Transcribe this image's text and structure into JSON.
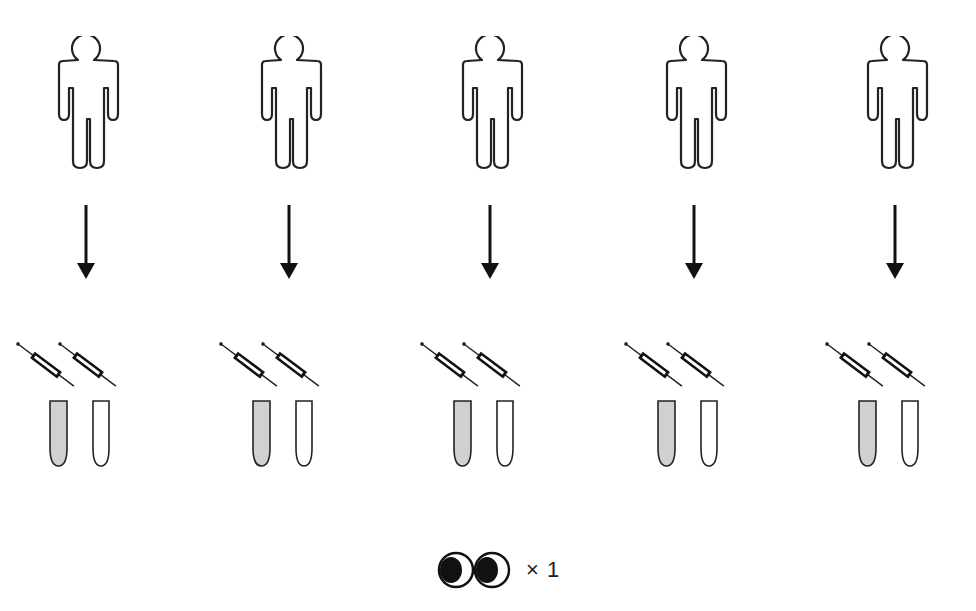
{
  "diagram": {
    "type": "sampling-schema",
    "columns": [
      {
        "id": 1,
        "center_x": 86,
        "person": "person-outline",
        "arrow": "down",
        "syringes": 2,
        "tubes": [
          {
            "fill": "gray"
          },
          {
            "fill": "empty"
          }
        ]
      },
      {
        "id": 2,
        "center_x": 289,
        "person": "person-outline",
        "arrow": "down",
        "syringes": 2,
        "tubes": [
          {
            "fill": "gray"
          },
          {
            "fill": "empty"
          }
        ]
      },
      {
        "id": 3,
        "center_x": 490,
        "person": "person-outline",
        "arrow": "down",
        "syringes": 2,
        "tubes": [
          {
            "fill": "gray"
          },
          {
            "fill": "empty"
          }
        ]
      },
      {
        "id": 4,
        "center_x": 694,
        "person": "person-outline",
        "arrow": "down",
        "syringes": 2,
        "tubes": [
          {
            "fill": "gray"
          },
          {
            "fill": "empty"
          }
        ]
      },
      {
        "id": 5,
        "center_x": 895,
        "person": "person-outline",
        "arrow": "down",
        "syringes": 2,
        "tubes": [
          {
            "fill": "gray"
          },
          {
            "fill": "empty"
          }
        ]
      }
    ],
    "legend": {
      "icon": "eyes-icon",
      "label": "× 1"
    },
    "colors": {
      "stroke": "#222222",
      "tube_fill": "#d0d0d0",
      "background": "#ffffff"
    }
  }
}
